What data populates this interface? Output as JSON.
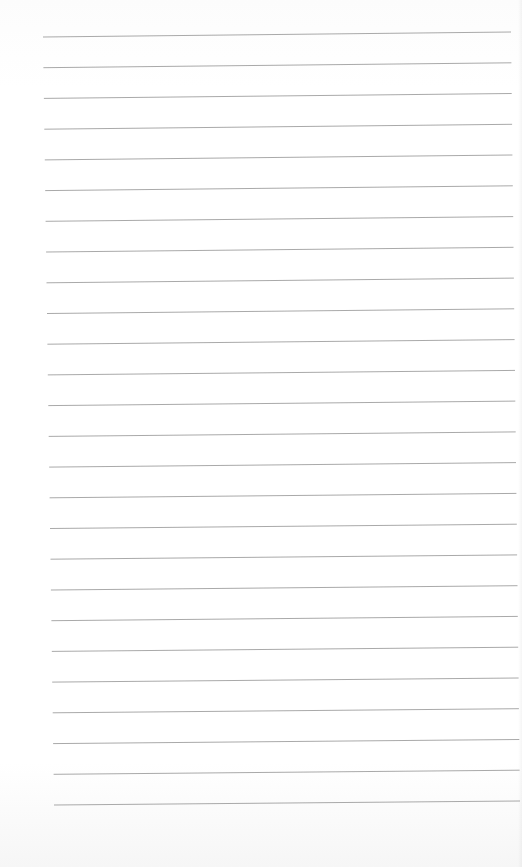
{
  "page": {
    "type": "lined-notebook-paper",
    "background_color": "#ffffff",
    "rule_color": "#9a9a9a",
    "rule_count": 26,
    "first_rule": {
      "x1": 43,
      "y1": 37,
      "x2": 511,
      "y2": 32
    },
    "last_rule": {
      "x1": 54,
      "y1": 805,
      "x2": 520,
      "y2": 801
    },
    "rule_spacing_px": 30.7,
    "text_content": ""
  }
}
